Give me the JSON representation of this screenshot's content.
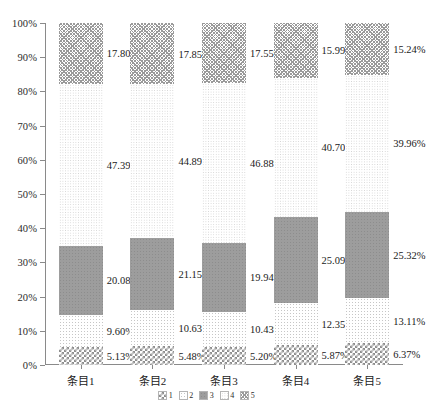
{
  "chart_data": {
    "type": "bar",
    "subtype": "stacked-100-percent",
    "title": "",
    "xlabel": "",
    "ylabel": "",
    "ylim": [
      0,
      100
    ],
    "ytick_labels": [
      "0%",
      "10%",
      "20%",
      "30%",
      "40%",
      "50%",
      "60%",
      "70%",
      "80%",
      "90%",
      "100%"
    ],
    "ytick_values": [
      0,
      10,
      20,
      30,
      40,
      50,
      60,
      70,
      80,
      90,
      100
    ],
    "grid": false,
    "legend_position": "bottom-center",
    "categories": [
      "条目1",
      "条目2",
      "条目3",
      "条目4",
      "条目5"
    ],
    "series": [
      {
        "name": "1",
        "pattern": "checkerboard",
        "values": [
          5.13,
          5.48,
          5.2,
          5.87,
          6.37
        ],
        "labels": [
          "5.13%",
          "5.48%",
          "5.20%",
          "5.87%",
          "6.37%"
        ]
      },
      {
        "name": "2",
        "pattern": "light-vertical-dots",
        "values": [
          9.6,
          10.63,
          10.43,
          12.35,
          13.11
        ],
        "labels": [
          "9.60%",
          "10.63%",
          "10.43%",
          "12.35%",
          "13.11%"
        ]
      },
      {
        "name": "3",
        "pattern": "solid-gray",
        "values": [
          20.08,
          21.15,
          19.94,
          25.09,
          25.32
        ],
        "labels": [
          "20.08%",
          "21.15%",
          "19.94%",
          "25.09%",
          "25.32%"
        ]
      },
      {
        "name": "4",
        "pattern": "fine-dots",
        "values": [
          47.39,
          44.89,
          46.88,
          40.7,
          39.96
        ],
        "labels": [
          "47.39%",
          "44.89%",
          "46.88%",
          "40.70%",
          "39.96%"
        ]
      },
      {
        "name": "5",
        "pattern": "cross-hatch",
        "values": [
          17.8,
          17.85,
          17.55,
          15.99,
          15.24
        ],
        "labels": [
          "17.80%",
          "17.85%",
          "17.55%",
          "15.99%",
          "15.24%"
        ]
      }
    ]
  },
  "legend": {
    "items": [
      {
        "label": "1",
        "pattern": "checkerboard"
      },
      {
        "label": "2",
        "pattern": "light-vertical-dots"
      },
      {
        "label": "3",
        "pattern": "solid-gray"
      },
      {
        "label": "4",
        "pattern": "fine-dots"
      },
      {
        "label": "5",
        "pattern": "cross-hatch"
      }
    ]
  },
  "colors": {
    "axis": "#8a8a8a",
    "text": "#1a1a1a",
    "background": "#ffffff",
    "series_gray": "#9d9d9d"
  }
}
